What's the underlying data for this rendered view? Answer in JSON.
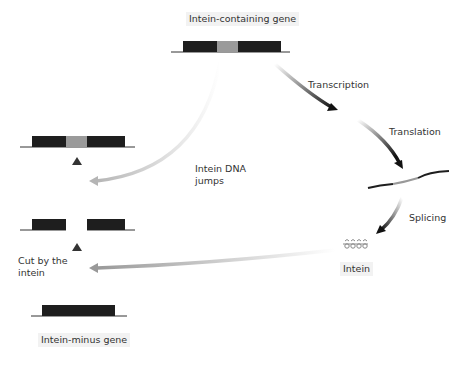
{
  "title": "Intein-containing gene",
  "labels": {
    "top_gene": "Intein-containing gene",
    "transcription": "Transcription",
    "translation": "Translation",
    "splicing": "Splicing",
    "intein": "Intein",
    "intein_dna_jumps_1": "Intein DNA",
    "intein_dna_jumps_2": "jumps",
    "cut_by_intein_1": "Cut by the",
    "cut_by_intein_2": "intein",
    "bottom_gene": "Intein-minus gene"
  },
  "colors": {
    "exon": "#1e1e1e",
    "intein_segment": "#9a9a9a",
    "arrow_dark": "#1a1a1a",
    "arrow_light": "#cccccc",
    "line": "#333333",
    "label_bg": "#f2f2f2"
  }
}
